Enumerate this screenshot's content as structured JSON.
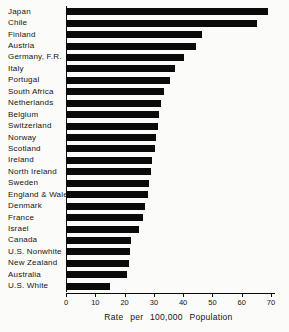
{
  "figure": {
    "background_color": "#fbfbf9",
    "bar_color": "#0a0a0a",
    "text_color": "#141414"
  },
  "chart_data": {
    "type": "bar",
    "orientation": "horizontal",
    "title": "",
    "xlabel": "Rate per 100,000 Population",
    "ylabel": "",
    "xlim": [
      0,
      70
    ],
    "xticks": [
      0,
      10,
      20,
      30,
      40,
      50,
      60,
      70
    ],
    "grid": false,
    "categories": [
      "Japan",
      "Chile",
      "Finland",
      "Austria",
      "Germany, F.R.",
      "Italy",
      "Portugal",
      "South Africa",
      "Netherlands",
      "Belgium",
      "Switzerland",
      "Norway",
      "Scotland",
      "Ireland",
      "North Ireland",
      "Sweden",
      "England & Wales",
      "Denmark",
      "France",
      "Israel",
      "Canada",
      "U.S. Nonwhite",
      "New Zealand",
      "Australia",
      "U.S. White"
    ],
    "values": [
      68.5,
      65,
      46,
      44,
      40,
      37,
      35,
      33,
      32,
      31.5,
      31,
      30.5,
      30,
      29,
      28.5,
      28,
      27.5,
      26.5,
      26,
      24.5,
      22,
      21.5,
      21,
      20.5,
      14.5
    ]
  }
}
